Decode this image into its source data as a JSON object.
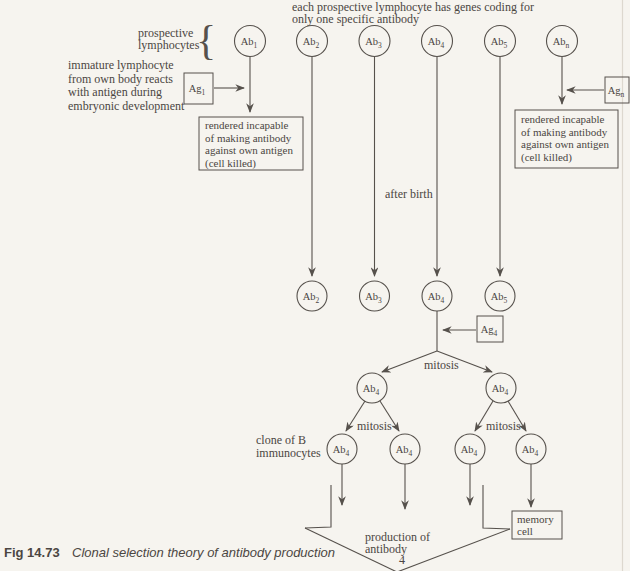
{
  "figure": {
    "header_note": [
      "each prospective lymphocyte has genes coding for",
      "only one specific antibody"
    ],
    "prospective_label": [
      "prospective",
      "lymphocytes"
    ],
    "brace": "{",
    "immature_note": [
      "immature lymphocyte",
      "from own body reacts",
      "with antigen during",
      "embryonic development"
    ],
    "rendered_incapable_note": [
      "rendered incapable",
      "of making antibody",
      "against own antigen",
      "(cell killed)"
    ],
    "after_birth": "after birth",
    "mitosis": "mitosis",
    "clone_label": [
      "clone of B",
      "immunocytes"
    ],
    "production_label": [
      "production of",
      "antibody",
      "4"
    ],
    "memory_cell": [
      "memory",
      "cell"
    ],
    "cells": {
      "top": [
        {
          "base": "Ab",
          "sub": "1"
        },
        {
          "base": "Ab",
          "sub": "2"
        },
        {
          "base": "Ab",
          "sub": "3"
        },
        {
          "base": "Ab",
          "sub": "4"
        },
        {
          "base": "Ab",
          "sub": "5"
        },
        {
          "base": "Ab",
          "sub": "n"
        }
      ],
      "surviving": [
        {
          "base": "Ab",
          "sub": "2"
        },
        {
          "base": "Ab",
          "sub": "3"
        },
        {
          "base": "Ab",
          "sub": "4"
        },
        {
          "base": "Ab",
          "sub": "5"
        }
      ],
      "generation2": [
        {
          "base": "Ab",
          "sub": "4"
        },
        {
          "base": "Ab",
          "sub": "4"
        }
      ],
      "generation3": [
        {
          "base": "Ab",
          "sub": "4"
        },
        {
          "base": "Ab",
          "sub": "4"
        },
        {
          "base": "Ab",
          "sub": "4"
        },
        {
          "base": "Ab",
          "sub": "4"
        }
      ]
    },
    "antigens": {
      "ag1": {
        "base": "Ag",
        "sub": "1"
      },
      "agn": {
        "base": "Ag",
        "sub": "n"
      },
      "ag4": {
        "base": "Ag",
        "sub": "4"
      }
    }
  },
  "caption": {
    "fig_number": "Fig 14.73",
    "title": "Clonal selection theory of antibody production"
  },
  "colors": {
    "ink": "#4b4642",
    "line": "#56514c",
    "background": "#f6f4ef"
  }
}
